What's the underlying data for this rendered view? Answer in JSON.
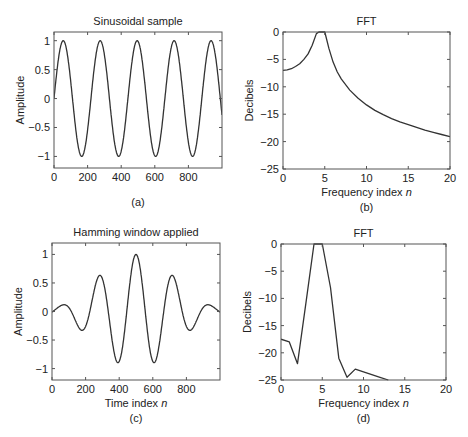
{
  "chart_data": [
    {
      "id": "a",
      "type": "line",
      "title": "Sinusoidal sample",
      "xlabel": "",
      "ylabel": "Amplitude",
      "caption": "(a)",
      "xlim": [
        0,
        1000
      ],
      "ylim": [
        -1.2,
        1.15
      ],
      "xticks": [
        0,
        200,
        400,
        600,
        800
      ],
      "yticks": [
        -1,
        -0.5,
        0,
        0.5,
        1
      ],
      "ytick_labels": [
        "−1",
        "−0.5",
        "0",
        "0.5",
        "1"
      ],
      "grid": false,
      "series": [
        {
          "name": "sine",
          "function": "sin(2*pi*n/220)",
          "n_range": [
            0,
            1000
          ],
          "amplitude": 1,
          "period": 220
        }
      ],
      "box": {
        "x0": 54,
        "y0": 32,
        "x1": 222,
        "y1": 168
      }
    },
    {
      "id": "b",
      "type": "line",
      "title": "FFT",
      "xlabel": "Frequency index n",
      "ylabel": "Decibels",
      "caption": "(b)",
      "xlim": [
        0,
        20
      ],
      "ylim": [
        -25,
        0
      ],
      "xticks": [
        0,
        5,
        10,
        15,
        20
      ],
      "yticks": [
        -25,
        -20,
        -15,
        -10,
        -5,
        0
      ],
      "ytick_labels": [
        "−25",
        "−20",
        "−15",
        "−10",
        "−5",
        "0"
      ],
      "grid": false,
      "series": [
        {
          "name": "FFT magnitude",
          "x": [
            0,
            0.5,
            1,
            1.5,
            2,
            2.5,
            3,
            3.5,
            4,
            4.3,
            4.6,
            5,
            5.5,
            6,
            6.5,
            7,
            8,
            9,
            10,
            11,
            12,
            13,
            14,
            15,
            16,
            17,
            18,
            19,
            20
          ],
          "y": [
            -7,
            -6.9,
            -6.7,
            -6.3,
            -5.8,
            -5,
            -4,
            -2.4,
            -0.3,
            0,
            0,
            0,
            -3,
            -5.5,
            -7.3,
            -8.6,
            -10.6,
            -12.1,
            -13.3,
            -14.3,
            -15.1,
            -15.8,
            -16.4,
            -16.9,
            -17.4,
            -17.9,
            -18.3,
            -18.7,
            -19.1
          ]
        }
      ],
      "box": {
        "x0": 283,
        "y0": 32,
        "x1": 450,
        "y1": 169
      }
    },
    {
      "id": "c",
      "type": "line",
      "title": "Hamming window applied",
      "xlabel": "Time index n",
      "ylabel": "Amplitude",
      "caption": "(c)",
      "xlim": [
        0,
        1000
      ],
      "ylim": [
        -1.2,
        1.2
      ],
      "xticks": [
        0,
        200,
        400,
        600,
        800
      ],
      "yticks": [
        -1,
        -0.5,
        0,
        0.5,
        1
      ],
      "ytick_labels": [
        "−1",
        "−0.5",
        "0",
        "0.5",
        "1"
      ],
      "grid": false,
      "series": [
        {
          "name": "windowed sine",
          "function": "hamming(n) * cos(2*pi*(n-500)/220)",
          "n_range": [
            0,
            1000
          ]
        }
      ],
      "box": {
        "x0": 52,
        "y0": 243,
        "x1": 220,
        "y1": 380
      }
    },
    {
      "id": "d",
      "type": "line",
      "title": "FFT",
      "xlabel": "Frequency index n",
      "ylabel": "Decibels",
      "caption": "(d)",
      "xlim": [
        0,
        20
      ],
      "ylim": [
        -25,
        0
      ],
      "xticks": [
        0,
        5,
        10,
        15,
        20
      ],
      "yticks": [
        -25,
        -20,
        -15,
        -10,
        -5,
        0
      ],
      "ytick_labels": [
        "−25",
        "−20",
        "−15",
        "−10",
        "−5",
        "0"
      ],
      "grid": false,
      "series": [
        {
          "name": "FFT magnitude",
          "x": [
            0,
            1,
            2,
            3,
            4,
            5,
            6,
            7,
            8,
            9,
            10,
            11,
            12,
            13
          ],
          "y": [
            -17.5,
            -18,
            -22,
            -11,
            0,
            0,
            -8,
            -21,
            -24.5,
            -23,
            -23.5,
            -24,
            -24.5,
            -25
          ]
        }
      ],
      "box": {
        "x0": 281,
        "y0": 244,
        "x1": 446,
        "y1": 380
      }
    }
  ]
}
